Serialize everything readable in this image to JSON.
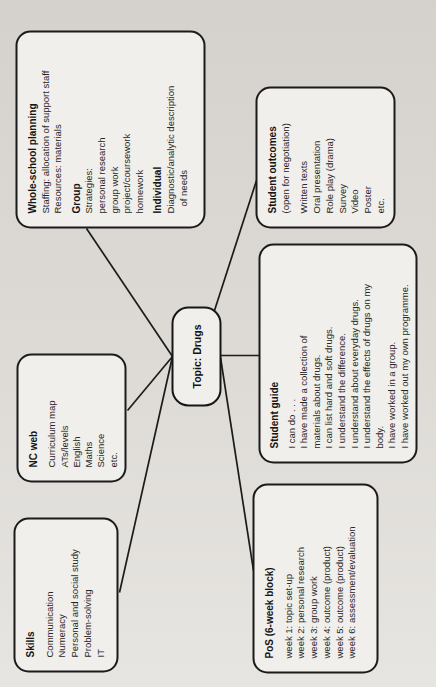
{
  "colors": {
    "page_background": "#dedbd7",
    "box_fill": "#f1efeb",
    "ink": "#1b1b1b"
  },
  "topic": {
    "label": "Topic: Drugs"
  },
  "skills": {
    "title": "Skills",
    "items": [
      "Communication",
      "Numeracy",
      "Personal and social study",
      "Problem-solving",
      "IT"
    ]
  },
  "nc_web": {
    "title": "NC web",
    "items": [
      "Curriculum map",
      "ATs/levels",
      "English",
      "Maths",
      "Science",
      "etc."
    ]
  },
  "whole_school_planning": {
    "title": "Whole-school planning",
    "staffing": "Staffing: allocation of support staff",
    "resources": "Resources: materials",
    "group_heading": "Group",
    "group_items": [
      "Strategies:",
      "personal research",
      "group work",
      "project/coursework",
      "homework"
    ],
    "individual_heading": "Individual",
    "individual_lines": [
      "Diagnostic/analytic description",
      "of needs"
    ]
  },
  "pos_block": {
    "title": "PoS (6-week block)",
    "items": [
      "week 1: topic set-up",
      "week 2: personal research",
      "week 3: group work",
      "week 4: outcome (product)",
      "week 5: outcome (product)",
      "week 6: assessment/evaluation"
    ]
  },
  "student_guide": {
    "title": "Student guide",
    "items": [
      "I can do . . .",
      "I have made a collection of",
      "materials about drugs.",
      "I can list hard and soft drugs.",
      "I understand the difference.",
      "I understand about everyday drugs.",
      "I understand the effects of drugs on my",
      "body.",
      "I have worked in a group.",
      "I have worked out my own programme."
    ]
  },
  "student_outcomes": {
    "title": "Student outcomes",
    "subtitle": "(open for negotiation)",
    "items": [
      "Written texts",
      "Oral presentation",
      "Role play (drama)",
      "Survey",
      "Video",
      "Poster",
      "etc."
    ]
  }
}
